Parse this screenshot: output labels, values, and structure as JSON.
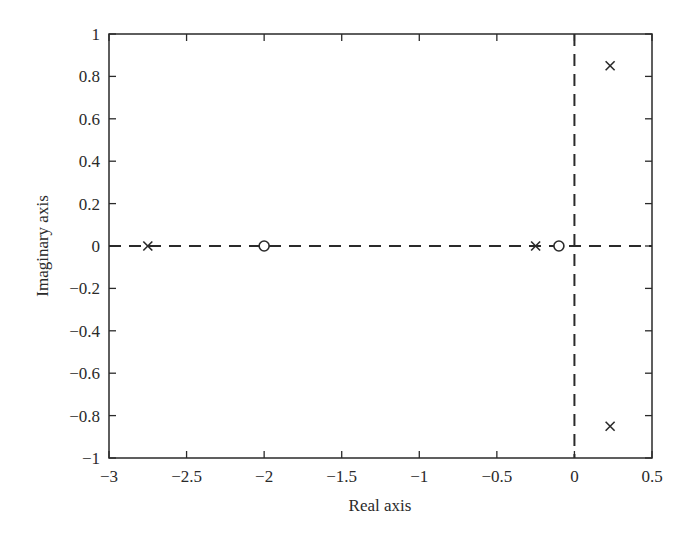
{
  "chart_data": {
    "type": "scatter",
    "title": "",
    "xlabel": "Real axis",
    "ylabel": "Imaginary axis",
    "xlim": [
      -3,
      0.5
    ],
    "ylim": [
      -1,
      1
    ],
    "grid": false,
    "legend": null,
    "x_ticks": [
      -3,
      -2.5,
      -2,
      -1.5,
      -1,
      -0.5,
      0,
      0.5
    ],
    "x_tick_labels": [
      "−3",
      "−2.5",
      "−2",
      "−1.5",
      "−1",
      "−0.5",
      "0",
      "0.5"
    ],
    "y_ticks": [
      1,
      0.8,
      0.6,
      0.4,
      0.2,
      0,
      -0.2,
      -0.4,
      -0.6,
      -0.8,
      -1
    ],
    "y_tick_labels": [
      "1",
      "0.8",
      "0.6",
      "0.4",
      "0.2",
      "0",
      "−0.2",
      "−0.4",
      "−0.6",
      "−0.8",
      "−1"
    ],
    "reference_lines": [
      {
        "orientation": "horizontal",
        "value": 0,
        "style": "dashed"
      },
      {
        "orientation": "vertical",
        "value": 0,
        "style": "dashed"
      }
    ],
    "series": [
      {
        "name": "poles",
        "marker": "x",
        "points": [
          {
            "x": -2.75,
            "y": 0
          },
          {
            "x": -0.25,
            "y": 0
          },
          {
            "x": 0.23,
            "y": 0.85
          },
          {
            "x": 0.23,
            "y": -0.85
          }
        ]
      },
      {
        "name": "zeros",
        "marker": "o",
        "points": [
          {
            "x": -2.0,
            "y": 0
          },
          {
            "x": -0.1,
            "y": 0
          }
        ]
      }
    ]
  }
}
